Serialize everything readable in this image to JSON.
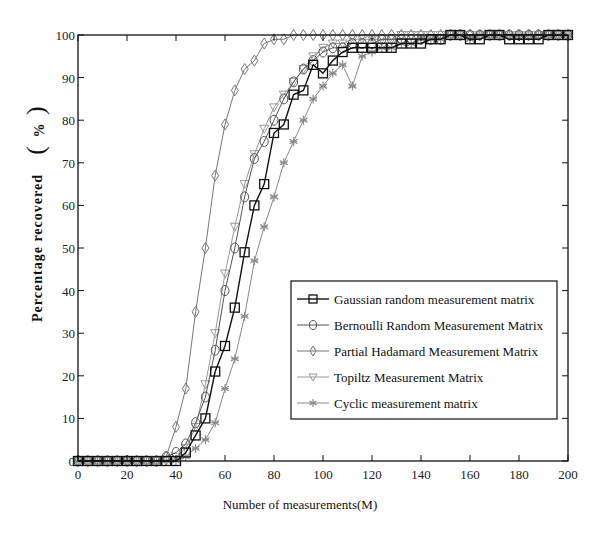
{
  "chart_data": {
    "type": "line",
    "title": "",
    "xlabel": "Number of measurements(M)",
    "ylabel": "Percentage recovered",
    "ylabel_unit": "%",
    "xlim": [
      0,
      200
    ],
    "ylim": [
      0,
      100
    ],
    "xticks": [
      0,
      20,
      40,
      60,
      80,
      100,
      120,
      140,
      160,
      180,
      200
    ],
    "yticks": [
      0,
      10,
      20,
      30,
      40,
      50,
      60,
      70,
      80,
      90,
      100
    ],
    "grid": false,
    "legend_position": "lower right",
    "series": [
      {
        "name": "Gaussian random measurement matrix",
        "marker": "square",
        "color": "#111111",
        "line_width": 1.4,
        "x": [
          0,
          4,
          8,
          12,
          16,
          20,
          24,
          28,
          32,
          36,
          40,
          44,
          48,
          52,
          56,
          60,
          64,
          68,
          72,
          76,
          80,
          84,
          88,
          92,
          96,
          100,
          104,
          108,
          112,
          116,
          120,
          124,
          128,
          132,
          136,
          140,
          144,
          148,
          152,
          156,
          160,
          164,
          168,
          172,
          176,
          180,
          184,
          188,
          192,
          196,
          200
        ],
        "y": [
          0,
          0,
          0,
          0,
          0,
          0,
          0,
          0,
          0,
          0,
          0,
          2,
          6,
          10,
          21,
          27,
          36,
          49,
          60,
          65,
          77,
          79,
          86,
          87,
          93,
          91,
          94,
          96,
          97,
          97,
          97,
          97,
          97,
          98,
          98,
          98,
          99,
          99,
          100,
          100,
          99,
          99,
          100,
          100,
          99,
          99,
          99,
          99,
          100,
          100,
          100
        ]
      },
      {
        "name": "Bernoulli Random Measurement Matrix",
        "marker": "circle",
        "color": "#555555",
        "line_width": 1.0,
        "x": [
          0,
          4,
          8,
          12,
          16,
          20,
          24,
          28,
          32,
          36,
          40,
          44,
          48,
          52,
          56,
          60,
          64,
          68,
          72,
          76,
          80,
          84,
          88,
          92,
          96,
          100,
          104,
          108,
          112,
          116,
          120,
          124,
          128,
          132,
          136,
          140,
          144,
          148,
          152,
          156,
          160,
          164,
          168,
          172,
          176,
          180,
          184,
          188,
          192,
          196,
          200
        ],
        "y": [
          0,
          0,
          0,
          0,
          0,
          0,
          0,
          0,
          0,
          1,
          2,
          4,
          9,
          15,
          26,
          40,
          50,
          62,
          71,
          75,
          80,
          85,
          89,
          92,
          94,
          96,
          97,
          97,
          98,
          98,
          98,
          99,
          99,
          99,
          99,
          99,
          99,
          99,
          100,
          100,
          100,
          100,
          100,
          100,
          100,
          100,
          100,
          100,
          100,
          100,
          100
        ]
      },
      {
        "name": "Partial Hadamard Measurement Matrix",
        "marker": "diamond",
        "color": "#777777",
        "line_width": 1.0,
        "x": [
          0,
          4,
          8,
          12,
          16,
          20,
          24,
          28,
          32,
          36,
          40,
          44,
          48,
          52,
          56,
          60,
          64,
          68,
          72,
          76,
          80,
          84,
          88,
          92,
          96,
          100,
          104,
          108,
          112,
          116,
          120,
          124,
          128,
          132,
          136,
          140,
          144,
          148,
          152,
          156,
          160,
          164,
          168,
          172,
          176,
          180,
          184,
          188,
          192,
          196,
          200
        ],
        "y": [
          0,
          0,
          0,
          0,
          0,
          0,
          0,
          0,
          0,
          1,
          8,
          17,
          35,
          50,
          67,
          79,
          87,
          92,
          94,
          98,
          99,
          99,
          100,
          100,
          100,
          100,
          100,
          100,
          100,
          100,
          100,
          100,
          100,
          100,
          100,
          100,
          100,
          100,
          100,
          100,
          100,
          100,
          100,
          100,
          100,
          100,
          100,
          100,
          100,
          100,
          100
        ]
      },
      {
        "name": "Topiltz Measurement Matrix",
        "marker": "triangle-down",
        "color": "#999999",
        "line_width": 1.0,
        "x": [
          0,
          4,
          8,
          12,
          16,
          20,
          24,
          28,
          32,
          36,
          40,
          44,
          48,
          52,
          56,
          60,
          64,
          68,
          72,
          76,
          80,
          84,
          88,
          92,
          96,
          100,
          104,
          108,
          112,
          116,
          120,
          124,
          128,
          132,
          136,
          140,
          144,
          148,
          152,
          156,
          160,
          164,
          168,
          172,
          176,
          180,
          184,
          188,
          192,
          196,
          200
        ],
        "y": [
          0,
          0,
          0,
          0,
          0,
          0,
          0,
          0,
          0,
          0,
          1,
          3,
          8,
          18,
          30,
          44,
          55,
          65,
          72,
          78,
          83,
          86,
          89,
          92,
          95,
          97,
          98,
          98,
          99,
          99,
          99,
          99,
          99,
          100,
          100,
          100,
          100,
          100,
          100,
          100,
          100,
          100,
          100,
          100,
          100,
          100,
          100,
          100,
          100,
          100,
          100
        ]
      },
      {
        "name": "Cyclic measurement matrix",
        "marker": "asterisk",
        "color": "#8a8a8a",
        "line_width": 1.0,
        "x": [
          0,
          4,
          8,
          12,
          16,
          20,
          24,
          28,
          32,
          36,
          40,
          44,
          48,
          52,
          56,
          60,
          64,
          68,
          72,
          76,
          80,
          84,
          88,
          92,
          96,
          100,
          104,
          108,
          112,
          116,
          120,
          124,
          128,
          132,
          136,
          140,
          144,
          148,
          152,
          156,
          160,
          164,
          168,
          172,
          176,
          180,
          184,
          188,
          192,
          196,
          200
        ],
        "y": [
          0,
          0,
          0,
          0,
          0,
          0,
          0,
          0,
          0,
          0,
          0,
          1,
          3,
          5,
          9,
          17,
          24,
          34,
          47,
          55,
          62,
          70,
          75,
          80,
          85,
          88,
          91,
          93,
          88,
          95,
          96,
          97,
          97,
          98,
          98,
          99,
          99,
          99,
          100,
          100,
          99,
          100,
          100,
          100,
          100,
          100,
          100,
          100,
          100,
          100,
          100
        ]
      }
    ]
  },
  "layout": {
    "plot_left": 78,
    "plot_right": 568,
    "plot_top": 35,
    "plot_bottom": 461,
    "legend_box": {
      "x": 291,
      "y": 281,
      "w": 266,
      "h": 138
    },
    "axis_color": "#111111"
  }
}
